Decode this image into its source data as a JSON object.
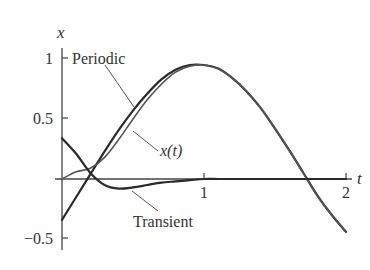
{
  "chart_data": {
    "type": "line",
    "title": "",
    "xlabel": "t",
    "ylabel": "x",
    "xlim": [
      0,
      2.05
    ],
    "ylim": [
      -0.55,
      1.1
    ],
    "grid": false,
    "legend_position": "inline annotations",
    "x_ticks": [
      {
        "value": 1,
        "label": "1"
      },
      {
        "value": 2,
        "label": "2"
      }
    ],
    "y_ticks": [
      {
        "value": 1,
        "label": "1"
      },
      {
        "value": 0.5,
        "label": "0.5"
      },
      {
        "value": -0.5,
        "label": "−0.5"
      }
    ],
    "x": [
      0,
      0.1,
      0.2,
      0.3,
      0.4,
      0.5,
      0.6,
      0.7,
      0.8,
      0.9,
      1.0,
      1.1,
      1.2,
      1.3,
      1.4,
      1.5,
      1.6,
      1.7,
      1.8,
      1.9,
      2.0
    ],
    "series": [
      {
        "name": "Periodic",
        "values": [
          -0.34,
          -0.15,
          0.04,
          0.23,
          0.41,
          0.57,
          0.71,
          0.83,
          0.91,
          0.95,
          0.95,
          0.92,
          0.84,
          0.73,
          0.59,
          0.42,
          0.24,
          0.05,
          -0.14,
          -0.3,
          -0.44
        ]
      },
      {
        "name": "x(t)",
        "values": [
          0.0,
          0.06,
          0.09,
          0.18,
          0.33,
          0.5,
          0.66,
          0.79,
          0.89,
          0.94,
          0.95,
          0.92,
          0.84,
          0.73,
          0.59,
          0.42,
          0.24,
          0.05,
          -0.14,
          -0.3,
          -0.44
        ]
      },
      {
        "name": "Transient",
        "values": [
          0.34,
          0.21,
          0.05,
          -0.05,
          -0.08,
          -0.07,
          -0.05,
          -0.03,
          -0.02,
          -0.01,
          0.0,
          0.0,
          0.0,
          0.0,
          0.0,
          0.0,
          0.0,
          0.0,
          0.0,
          0.0,
          0.0
        ]
      }
    ],
    "annotations": [
      {
        "text": "Periodic",
        "points_to": "Periodic",
        "x_label": 0.05,
        "y_label": 1.0
      },
      {
        "text": "x(t)",
        "points_to": "x(t)",
        "x_label": 0.93,
        "y_label": 0.22
      },
      {
        "text": "Transient",
        "points_to": "Transient",
        "x_label": 0.48,
        "y_label": -0.21
      }
    ]
  },
  "labels": {
    "y_axis": "x",
    "x_axis": "t",
    "tick_1y": "1",
    "tick_05y": "0.5",
    "tick_neg05y": "−0.5",
    "tick_1x": "1",
    "tick_2x": "2",
    "periodic": "Periodic",
    "xt": "x(t)",
    "transient": "Transient"
  }
}
